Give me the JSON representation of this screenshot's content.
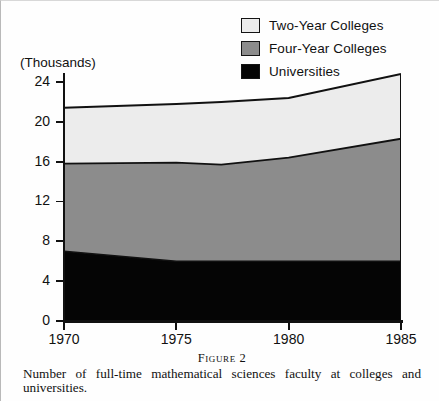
{
  "chart_data": {
    "type": "area",
    "stacked": true,
    "title": "",
    "subtitle": "",
    "xlabel": "",
    "ylabel": "(Thousands)",
    "xlim": [
      1970,
      1985
    ],
    "ylim": [
      0,
      24
    ],
    "grid": false,
    "legend_position": "top-right",
    "x_ticks": [
      1970,
      1975,
      1980,
      1985
    ],
    "y_ticks": [
      0,
      4,
      8,
      12,
      16,
      20,
      24
    ],
    "x": [
      1970,
      1975,
      1977,
      1980,
      1985
    ],
    "series": [
      {
        "name": "Universities",
        "color": "#050505",
        "values": [
          7.0,
          6.0,
          6.0,
          6.0,
          6.0
        ]
      },
      {
        "name": "Four-Year Colleges",
        "color": "#8c8c8c",
        "values": [
          8.8,
          9.9,
          9.7,
          10.4,
          12.3
        ]
      },
      {
        "name": "Two-Year Colleges",
        "color": "#ececec",
        "values": [
          5.6,
          5.9,
          6.3,
          6.0,
          6.5
        ]
      }
    ],
    "cumulative_tops": {
      "universities": [
        7.0,
        6.0,
        6.0,
        6.0,
        6.0
      ],
      "four_year_colleges": [
        15.8,
        15.9,
        15.7,
        16.4,
        18.3
      ],
      "two_year_colleges": [
        21.4,
        21.8,
        22.0,
        22.4,
        24.8
      ]
    }
  },
  "legend": {
    "items": [
      {
        "label": "Two-Year Colleges",
        "swatch": "#ececec"
      },
      {
        "label": "Four-Year Colleges",
        "swatch": "#8c8c8c"
      },
      {
        "label": "Universities",
        "swatch": "#050505"
      }
    ]
  },
  "axes": {
    "y_title": "(Thousands)",
    "y_tick_labels": [
      "24",
      "20",
      "16",
      "12",
      "8",
      "4",
      "0"
    ],
    "x_tick_labels": [
      "1970",
      "1975",
      "1980",
      "1985"
    ]
  },
  "caption": {
    "figure_number": "Figure 2",
    "text": "Number of full-time mathematical sciences faculty at colleges and universities."
  }
}
